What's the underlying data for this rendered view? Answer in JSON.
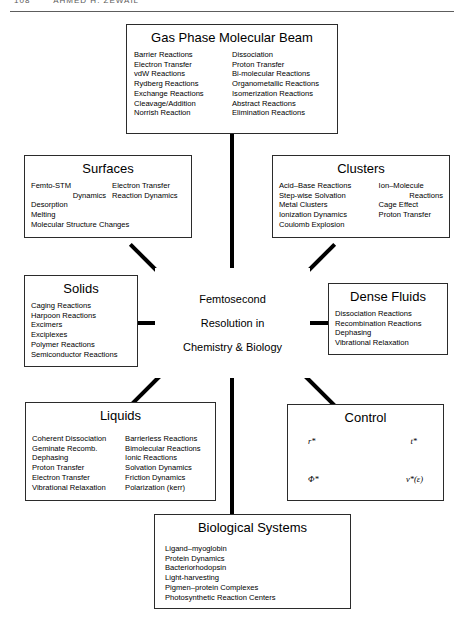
{
  "page": {
    "running_head_number": "108",
    "running_head_title": "AHMED  H. ZEWAIL"
  },
  "center": {
    "lines": [
      "Femtosecond",
      "Resolution in",
      "Chemistry & Biology"
    ]
  },
  "boxes": {
    "gas_phase": {
      "title": "Gas Phase Molecular Beam",
      "col1": [
        "Barrier Reactions",
        "Electron Transfer",
        "vdW Reactions",
        "Rydberg Reactions",
        "Exchange Reactions",
        "Cleavage/Addition",
        "Norrish Reaction"
      ],
      "col2": [
        "Dissociation",
        "Proton Transfer",
        "Bi-molecular Reactions",
        "Organometallic Reactions",
        "Isomerization Reactions",
        "Abstract Reactions",
        "Elimination Reactions"
      ]
    },
    "surfaces": {
      "title": "Surfaces",
      "col1": [
        "Femto-STM",
        "Dynamics",
        "Desorption",
        "Melting",
        "Molecular Structure Changes"
      ],
      "col2": [
        "Electron Transfer",
        "Reaction Dynamics"
      ]
    },
    "clusters": {
      "title": "Clusters",
      "col1": [
        "Acid–Base Reactions",
        "Step-wise Solvation",
        "Metal Clusters",
        "Ionization Dynamics",
        "Coulomb Explosion"
      ],
      "col2": [
        "Ion–Molecule",
        "Reactions",
        "Cage Effect",
        "Proton Transfer"
      ]
    },
    "solids": {
      "title": "Solids",
      "col1": [
        "Caging Reactions",
        "Harpoon Reactions",
        "Excimers",
        "Exciplexes",
        "Polymer Reactions",
        "Semiconductor Reactions"
      ]
    },
    "dense_fluids": {
      "title": "Dense Fluids",
      "col1": [
        "Dissociation Reactions",
        "Recombination Reactions",
        "Dephasing",
        "Vibrational Relaxation"
      ]
    },
    "liquids": {
      "title": "Liquids",
      "col1": [
        "Coherent Dissociation",
        "Geminate Recomb.",
        "Dephasing",
        "Proton Transfer",
        "Electron Transfer",
        "Vibrational Relaxation"
      ],
      "col2": [
        "Barrierless Reactions",
        "Bimolecular Reactions",
        "Ionic Reactions",
        "Solvation Dynamics",
        "Friction Dynamics",
        "Polarization (kerr)"
      ]
    },
    "control": {
      "title": "Control",
      "symbols": {
        "r": "r*",
        "t": "t*",
        "phi": "Φ*",
        "v": "v*(ε)"
      }
    },
    "biological": {
      "title": "Biological Systems",
      "col1": [
        "Ligand–myoglobin",
        "Protein Dynamics",
        "Bacteriorhodopsin",
        "Light-harvesting",
        "Pigmen–protein Complexes",
        "Photosynthetic Reaction Centers"
      ]
    }
  },
  "colors": {
    "ink": "#000000",
    "box_border": "#2b2b2b",
    "rule": "#5d5d5d",
    "background": "#ffffff"
  }
}
